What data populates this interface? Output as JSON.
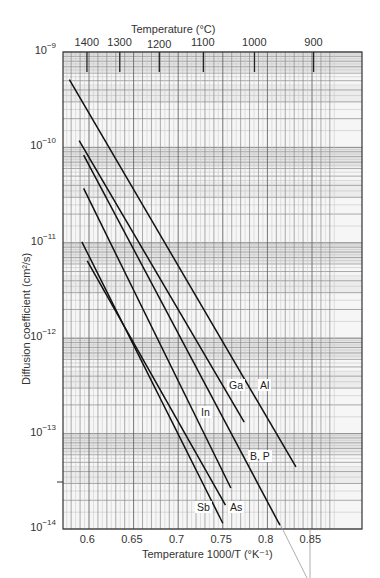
{
  "chart_data": {
    "type": "line",
    "title": "",
    "xlabel": "Temperature 1000/T (°K⁻¹)",
    "ylabel": "Diffusion coefficient (cm²/s)",
    "top_axis_label": "Temperature (°C)",
    "x_scale": "linear",
    "y_scale": "log",
    "xlim": [
      0.571,
      0.88
    ],
    "ylim": [
      1e-14,
      1e-09
    ],
    "x_ticks": [
      0.6,
      0.65,
      0.7,
      0.75,
      0.8,
      0.85
    ],
    "x_tick_labels": [
      "0.6",
      "0.65",
      "0.7",
      "0.75",
      "0.8",
      "0.85"
    ],
    "y_ticks": [
      1e-09,
      1e-10,
      1e-11,
      1e-12,
      1e-13,
      1e-14
    ],
    "y_tick_labels": [
      {
        "base": "10",
        "exp": "−9"
      },
      {
        "base": "10",
        "exp": "−10"
      },
      {
        "base": "10",
        "exp": "−11"
      },
      {
        "base": "10",
        "exp": "−12"
      },
      {
        "base": "10",
        "exp": "−13"
      },
      {
        "base": "10",
        "exp": "−14"
      }
    ],
    "top_ticks": [
      {
        "label": "1400",
        "x": 0.5977
      },
      {
        "label": "1300",
        "x": 0.6345
      },
      {
        "label": "1200",
        "x": 0.6788
      },
      {
        "label": "1100",
        "x": 0.7282
      },
      {
        "label": "1000",
        "x": 0.7855
      },
      {
        "label": "900",
        "x": 0.8518
      }
    ],
    "grid": true,
    "legend": "inline labels",
    "series": [
      {
        "name": "Al",
        "x": [
          0.578,
          0.832
        ],
        "log10_y": [
          -9.29,
          -13.35
        ]
      },
      {
        "name": "Ga",
        "x": [
          0.589,
          0.774
        ],
        "log10_y": [
          -9.93,
          -12.88
        ]
      },
      {
        "name": "B, P",
        "x": [
          0.594,
          0.814
        ],
        "log10_y": [
          -10.08,
          -13.96
        ]
      },
      {
        "name": "In",
        "x": [
          0.594,
          0.759
        ],
        "log10_y": [
          -10.43,
          -13.57
        ]
      },
      {
        "name": "Sb",
        "x": [
          0.592,
          0.75
        ],
        "log10_y": [
          -10.99,
          -13.94
        ]
      },
      {
        "name": "As",
        "x": [
          0.598,
          0.753
        ],
        "log10_y": [
          -11.19,
          -13.75
        ]
      }
    ],
    "series_labels": [
      {
        "name": "Ga",
        "left": 227,
        "top": 379
      },
      {
        "name": "Al",
        "left": 258,
        "top": 379
      },
      {
        "name": "In",
        "left": 199,
        "top": 406
      },
      {
        "name": "B, P",
        "left": 248,
        "top": 450
      },
      {
        "name": "Sb",
        "left": 195,
        "top": 501
      },
      {
        "name": "As",
        "left": 228,
        "top": 501
      }
    ]
  }
}
